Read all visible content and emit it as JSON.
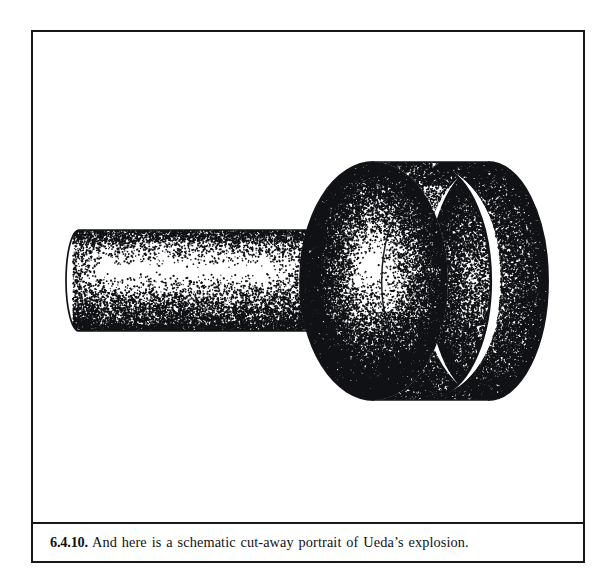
{
  "page": {
    "background_color": "#ffffff",
    "ink_color": "#17181a",
    "width": 613,
    "height": 588
  },
  "figure": {
    "frame": {
      "border_color": "#17181a",
      "border_width": 2
    },
    "plate": {
      "label": "stippled technical line illustration",
      "background_color": "#ffffff"
    },
    "caption": {
      "number": "6.4.10.",
      "body": "And here is a schematic cut-away portrait of Ueda’s explosion.",
      "full_text": "6.4.10. And here is a schematic cut-away portrait of Ueda’s explosion.",
      "text_color": "#111214"
    }
  },
  "illustration": {
    "title": "schematic cut-away portrait of Ueda's explosion",
    "technique": "stipple / dot shading pen-and-ink",
    "line_color": "#121317",
    "dot_color": "#101114",
    "parts": [
      {
        "name": "shaft",
        "description": "narrow horizontal cylinder entering from the left",
        "left": 77,
        "right": 310,
        "top": 228,
        "bottom": 329,
        "cap_rx": 13
      },
      {
        "name": "drum",
        "description": "large cylinder, cut away to show hollow interior",
        "left": 296,
        "right": 556,
        "top": 160,
        "bottom": 402,
        "front_rim_cx": 372,
        "front_rim_rx": 74,
        "front_rim_ry": 120
      },
      {
        "name": "cut-away-rim",
        "description": "inner crescent wall revealed by the cut-away, right end",
        "cx": 496,
        "rx": 60,
        "ry": 119
      }
    ]
  }
}
